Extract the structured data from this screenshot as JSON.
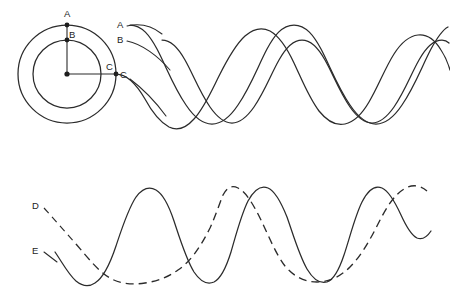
{
  "figure": {
    "title": "",
    "background_color": "#ffffff",
    "stroke_color": "#2b2b2b"
  },
  "circle_diagram": {
    "center": {
      "x": 67,
      "y": 74
    },
    "outer_circle_radius": 49,
    "inner_circle_radius": 34,
    "points": [
      {
        "label": "A",
        "x": 67,
        "y": 25,
        "on": "outer-circle-top"
      },
      {
        "label": "B",
        "x": 67,
        "y": 40,
        "on": "inner-circle-top"
      },
      {
        "label": "C",
        "x": 116,
        "y": 74,
        "on": "outer-circle-right"
      }
    ],
    "radius_lines": [
      {
        "from": "center",
        "to": "A"
      },
      {
        "from": "center",
        "to": "C"
      }
    ],
    "labels": {
      "a": "A",
      "b": "B",
      "c": "C"
    }
  },
  "upper_waves": {
    "labels": {
      "a": "A",
      "b": "B",
      "c": "C"
    },
    "baseline_y": 74,
    "x_start": 130,
    "x_end": 445,
    "wavelength": 150,
    "series": [
      {
        "name": "A",
        "label": "A",
        "amplitude": 49,
        "phase_deg": 90,
        "start_y": 25,
        "style": "solid"
      },
      {
        "name": "B",
        "label": "B",
        "amplitude": 34,
        "phase_deg": 90,
        "start_y": 40,
        "style": "solid"
      },
      {
        "name": "C",
        "label": "C",
        "amplitude": 49,
        "phase_deg": 0,
        "start_y": 74,
        "style": "solid"
      }
    ]
  },
  "lower_waves": {
    "labels": {
      "d": "D",
      "e": "E"
    },
    "baseline_y": 236,
    "x_start": 55,
    "x_end": 430,
    "series": [
      {
        "name": "D",
        "label": "D",
        "amplitude": 50,
        "wavelength": 188,
        "phase_deg": 35,
        "style": "dashed",
        "start_y": 210
      },
      {
        "name": "E",
        "label": "E",
        "amplitude": 50,
        "wavelength": 94,
        "phase_deg": 35,
        "style": "solid",
        "start_y": 252
      }
    ],
    "coincident_peak_x": 220
  }
}
